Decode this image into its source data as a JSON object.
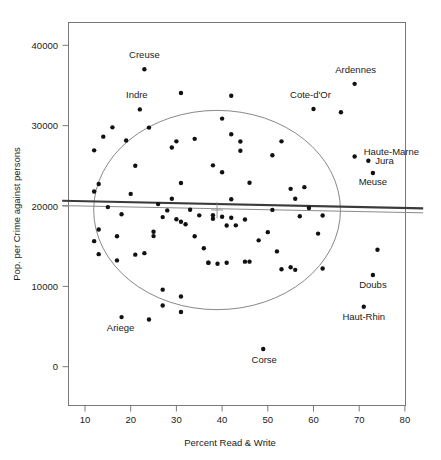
{
  "figure": {
    "title": "",
    "background": "#ffffff",
    "point_color": "#111111",
    "ellipse_color": "#7a7a7a",
    "regression_color": "#3b3b3b",
    "alt_line_color": "#8a8a8a"
  },
  "axes": {
    "x_title": "Percent Read & Write",
    "y_title": "Pop. per Crime against persons",
    "x_ticks": [
      "10",
      "20",
      "30",
      "40",
      "50",
      "60",
      "70",
      "80"
    ],
    "y_ticks": [
      "0",
      "10000",
      "20000",
      "30000",
      "40000"
    ]
  },
  "chart_data": {
    "type": "scatter",
    "title": "",
    "xlabel": "Percent Read & Write",
    "ylabel": "Pop. per Crime against persons",
    "xlim": [
      5,
      84
    ],
    "ylim": [
      -2200,
      42000
    ],
    "xticks": [
      10,
      20,
      30,
      40,
      50,
      60,
      70,
      80
    ],
    "yticks": [
      0,
      10000,
      20000,
      30000,
      40000
    ],
    "grid": false,
    "legend": "none",
    "annotations": [
      {
        "label": "Creuse",
        "x": 23,
        "y": 37014,
        "dx": 0,
        "dy": -11,
        "anchor": "middle"
      },
      {
        "label": "Indre",
        "x": 22,
        "y": 32020,
        "dx": -3,
        "dy": -11,
        "anchor": "middle"
      },
      {
        "label": "Ardennes",
        "x": 69,
        "y": 35203,
        "dx": 1,
        "dy": -11,
        "anchor": "middle"
      },
      {
        "label": "Cote-d'Or",
        "x": 60,
        "y": 32066,
        "dx": -3,
        "dy": -11,
        "anchor": "middle"
      },
      {
        "label": "Haute-Marne",
        "x": 69,
        "y": 26160,
        "dx": 9,
        "dy": -2,
        "anchor": "start"
      },
      {
        "label": "Jura",
        "x": 72,
        "y": 25630,
        "dx": 7,
        "dy": 3,
        "anchor": "start"
      },
      {
        "label": "Meuse",
        "x": 73,
        "y": 24116,
        "dx": 0,
        "dy": 12,
        "anchor": "middle"
      },
      {
        "label": "Doubs",
        "x": 73,
        "y": 11417,
        "dx": 0,
        "dy": 13,
        "anchor": "middle"
      },
      {
        "label": "Haut-Rhin",
        "x": 71,
        "y": 7452,
        "dx": 0,
        "dy": 13,
        "anchor": "middle"
      },
      {
        "label": "Ariege",
        "x": 18,
        "y": 6170,
        "dx": -1,
        "dy": 14,
        "anchor": "middle"
      },
      {
        "label": "Corse",
        "x": 49,
        "y": 2199,
        "dx": 1,
        "dy": 14,
        "anchor": "middle"
      }
    ],
    "points": [
      {
        "x": 12,
        "y": 15623
      },
      {
        "x": 12,
        "y": 21801
      },
      {
        "x": 12,
        "y": 26924
      },
      {
        "x": 13,
        "y": 17081
      },
      {
        "x": 13,
        "y": 22729
      },
      {
        "x": 13,
        "y": 14006
      },
      {
        "x": 14,
        "y": 28629
      },
      {
        "x": 15,
        "y": 19860
      },
      {
        "x": 16,
        "y": 29789
      },
      {
        "x": 17,
        "y": 16227
      },
      {
        "x": 17,
        "y": 13227
      },
      {
        "x": 18,
        "y": 6170
      },
      {
        "x": 18,
        "y": 18967
      },
      {
        "x": 19,
        "y": 28161
      },
      {
        "x": 20,
        "y": 21508
      },
      {
        "x": 21,
        "y": 13945
      },
      {
        "x": 21,
        "y": 25016
      },
      {
        "x": 22,
        "y": 32020
      },
      {
        "x": 23,
        "y": 37014
      },
      {
        "x": 23,
        "y": 14132
      },
      {
        "x": 24,
        "y": 5880
      },
      {
        "x": 24,
        "y": 29757
      },
      {
        "x": 25,
        "y": 16256
      },
      {
        "x": 25,
        "y": 16798
      },
      {
        "x": 26,
        "y": 20235
      },
      {
        "x": 27,
        "y": 9588
      },
      {
        "x": 27,
        "y": 7616
      },
      {
        "x": 27,
        "y": 18621
      },
      {
        "x": 28,
        "y": 19455
      },
      {
        "x": 29,
        "y": 27285
      },
      {
        "x": 29,
        "y": 20911
      },
      {
        "x": 30,
        "y": 28046
      },
      {
        "x": 30,
        "y": 18351
      },
      {
        "x": 31,
        "y": 34061
      },
      {
        "x": 31,
        "y": 8741
      },
      {
        "x": 31,
        "y": 6810
      },
      {
        "x": 31,
        "y": 18043
      },
      {
        "x": 31,
        "y": 22868
      },
      {
        "x": 32,
        "y": 17720
      },
      {
        "x": 33,
        "y": 19527
      },
      {
        "x": 34,
        "y": 28355
      },
      {
        "x": 34,
        "y": 16234
      },
      {
        "x": 35,
        "y": 18836
      },
      {
        "x": 36,
        "y": 14739
      },
      {
        "x": 37,
        "y": 12935
      },
      {
        "x": 37,
        "y": 12935
      },
      {
        "x": 38,
        "y": 25061
      },
      {
        "x": 38,
        "y": 18859
      },
      {
        "x": 38,
        "y": 18405
      },
      {
        "x": 39,
        "y": 12810
      },
      {
        "x": 40,
        "y": 24199
      },
      {
        "x": 40,
        "y": 30876
      },
      {
        "x": 40,
        "y": 18664
      },
      {
        "x": 41,
        "y": 17577
      },
      {
        "x": 41,
        "y": 12935
      },
      {
        "x": 42,
        "y": 28925
      },
      {
        "x": 42,
        "y": 18541
      },
      {
        "x": 42,
        "y": 33720
      },
      {
        "x": 42,
        "y": 20840
      },
      {
        "x": 43,
        "y": 17592
      },
      {
        "x": 44,
        "y": 28035
      },
      {
        "x": 44,
        "y": 26875
      },
      {
        "x": 45,
        "y": 13077
      },
      {
        "x": 45,
        "y": 18326
      },
      {
        "x": 46,
        "y": 13077
      },
      {
        "x": 46,
        "y": 22902
      },
      {
        "x": 48,
        "y": 15723
      },
      {
        "x": 49,
        "y": 2199
      },
      {
        "x": 50,
        "y": 16748
      },
      {
        "x": 51,
        "y": 26314
      },
      {
        "x": 51,
        "y": 19513
      },
      {
        "x": 52,
        "y": 14351
      },
      {
        "x": 53,
        "y": 28049
      },
      {
        "x": 53,
        "y": 12121
      },
      {
        "x": 55,
        "y": 22132
      },
      {
        "x": 55,
        "y": 12371
      },
      {
        "x": 56,
        "y": 20902
      },
      {
        "x": 56,
        "y": 12053
      },
      {
        "x": 57,
        "y": 18716
      },
      {
        "x": 58,
        "y": 22347
      },
      {
        "x": 59,
        "y": 19750
      },
      {
        "x": 60,
        "y": 32066
      },
      {
        "x": 61,
        "y": 16563
      },
      {
        "x": 62,
        "y": 12230
      },
      {
        "x": 62,
        "y": 18826
      },
      {
        "x": 66,
        "y": 31661
      },
      {
        "x": 69,
        "y": 35203
      },
      {
        "x": 69,
        "y": 26160
      },
      {
        "x": 71,
        "y": 7452
      },
      {
        "x": 72,
        "y": 25630
      },
      {
        "x": 73,
        "y": 24116
      },
      {
        "x": 73,
        "y": 11417
      },
      {
        "x": 74,
        "y": 14561
      }
    ],
    "regression_lines": [
      {
        "name": "ols-fit",
        "style": "thick-dark",
        "x0": 5,
        "y0": 20650,
        "x1": 84,
        "y1": 19700
      },
      {
        "name": "robust-fit",
        "style": "thin-gray",
        "x0": 5,
        "y0": 20050,
        "x1": 84,
        "y1": 19150
      }
    ],
    "data_ellipse": {
      "center_x": 38.9,
      "center_y": 19500,
      "semi_x": 27.0,
      "semi_y": 12400,
      "color": "#7a7a7a"
    }
  }
}
